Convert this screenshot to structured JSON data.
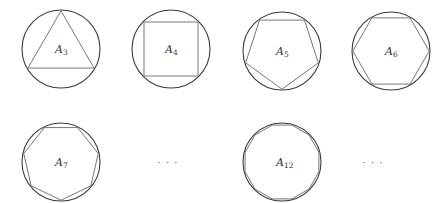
{
  "figure": {
    "shapes": [
      {
        "id": "A3",
        "label": "A",
        "subscript": "3",
        "sides": 3,
        "cx": 61,
        "cy": 49,
        "r": 39,
        "rotation_deg": -90
      },
      {
        "id": "A4",
        "label": "A",
        "subscript": "4",
        "sides": 4,
        "cx": 171,
        "cy": 49,
        "r": 39,
        "rotation_deg": -45
      },
      {
        "id": "A5",
        "label": "A",
        "subscript": "5",
        "sides": 5,
        "cx": 282,
        "cy": 51,
        "r": 39,
        "rotation_deg": 90
      },
      {
        "id": "A6",
        "label": "A",
        "subscript": "6",
        "sides": 6,
        "cx": 391,
        "cy": 51,
        "r": 39,
        "rotation_deg": 0
      },
      {
        "id": "A7",
        "label": "A",
        "subscript": "7",
        "sides": 7,
        "cx": 61,
        "cy": 162,
        "r": 39,
        "rotation_deg": 90
      },
      {
        "id": "A12",
        "label": "A",
        "subscript": "12",
        "sides": 12,
        "cx": 282,
        "cy": 162,
        "r": 39,
        "rotation_deg": 15
      }
    ],
    "ellipses": [
      {
        "text": "· · ·",
        "x": 168,
        "y": 166
      },
      {
        "text": "· · ·",
        "x": 373,
        "y": 166
      }
    ]
  }
}
